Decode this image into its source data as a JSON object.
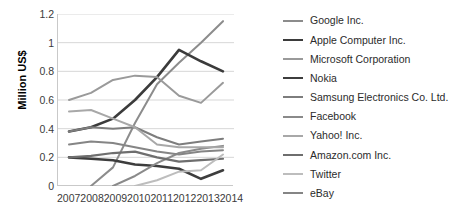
{
  "chart_data": {
    "type": "line",
    "title": "",
    "xlabel": "",
    "ylabel": "Million US$",
    "x": [
      "2007",
      "2008",
      "2009",
      "2010",
      "2011",
      "2012",
      "2013",
      "2014"
    ],
    "xlim": [
      "2007",
      "2014"
    ],
    "ylim": [
      0,
      1.2
    ],
    "ytick_labels": [
      "1.2",
      "1",
      "0.8",
      "0.6",
      "0.4",
      "0.2",
      "0"
    ],
    "ytick_values": [
      1.2,
      1.0,
      0.8,
      0.6,
      0.4,
      0.2,
      0
    ],
    "grid": "horizontal",
    "legend_position": "right",
    "series": [
      {
        "name": "Google Inc.",
        "color": "#8c8c8c",
        "width": 2.0,
        "values": [
          0.0,
          0.0,
          0.13,
          0.44,
          0.71,
          0.86,
          1.0,
          1.15
        ]
      },
      {
        "name": "Apple Computer Inc.",
        "color": "#3b3b3b",
        "width": 2.6,
        "values": [
          0.38,
          0.41,
          0.47,
          0.6,
          0.76,
          0.95,
          0.87,
          0.8
        ]
      },
      {
        "name": "Microsoft Corporation",
        "color": "#9a9a9a",
        "width": 2.0,
        "values": [
          0.6,
          0.65,
          0.74,
          0.77,
          0.76,
          0.63,
          0.58,
          0.72
        ]
      },
      {
        "name": "Nokia",
        "color": "#3d3d3d",
        "width": 2.6,
        "values": [
          0.2,
          0.19,
          0.18,
          0.15,
          0.14,
          0.12,
          0.05,
          0.11
        ]
      },
      {
        "name": "Samsung Electronics Co. Ltd.",
        "color": "#7d7d7d",
        "width": 2.0,
        "values": [
          0.38,
          0.41,
          0.4,
          0.41,
          0.34,
          0.29,
          0.31,
          0.33
        ]
      },
      {
        "name": "Facebook",
        "color": "#8a8a8a",
        "width": 2.0,
        "values": [
          0.0,
          0.0,
          0.0,
          0.07,
          0.16,
          0.23,
          0.26,
          0.28
        ]
      },
      {
        "name": "Yahoo! Inc.",
        "color": "#a8a8a8",
        "width": 2.0,
        "values": [
          0.52,
          0.53,
          0.47,
          0.41,
          0.29,
          0.27,
          0.27,
          0.27
        ]
      },
      {
        "name": "Amazon.com Inc.",
        "color": "#6e6e6e",
        "width": 2.2,
        "values": [
          0.2,
          0.21,
          0.23,
          0.24,
          0.2,
          0.17,
          0.18,
          0.19
        ]
      },
      {
        "name": "Twitter",
        "color": "#bdbdbd",
        "width": 2.0,
        "values": [
          0.0,
          0.0,
          0.0,
          0.0,
          0.04,
          0.1,
          0.11,
          0.22
        ]
      },
      {
        "name": "eBay",
        "color": "#858585",
        "width": 2.0,
        "values": [
          0.29,
          0.31,
          0.3,
          0.27,
          0.24,
          0.22,
          0.24,
          0.25
        ]
      }
    ]
  }
}
